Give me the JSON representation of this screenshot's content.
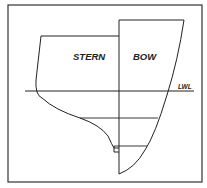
{
  "diagram": {
    "labels": {
      "stern": "STERN",
      "bow": "BOW",
      "lwl": "LWL"
    },
    "colors": {
      "line": "#222222",
      "background": "#ffffff",
      "frame": "#333333"
    }
  }
}
